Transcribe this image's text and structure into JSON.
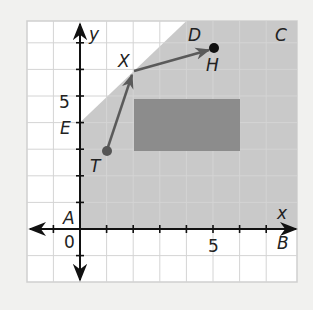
{
  "figure": {
    "type": "coordinate-plane",
    "grid": {
      "x_min": -2,
      "x_max": 8,
      "y_min": -2,
      "y_max": 8,
      "step": 1
    },
    "axes": {
      "x_label": "x",
      "y_label": "y",
      "origin_label": "0",
      "x_tick_label": "5",
      "y_tick_label": "5"
    },
    "shaded_region": {
      "vertices": [
        [
          0,
          0
        ],
        [
          8,
          0
        ],
        [
          8,
          8
        ],
        [
          4,
          8
        ],
        [
          0,
          4
        ]
      ],
      "color": "#c9c9c9"
    },
    "rectangle": {
      "x1": 2,
      "y1": 3,
      "x2": 6,
      "y2": 5,
      "color": "#8c8c8c"
    },
    "vertex_labels": [
      {
        "name": "A",
        "text": "A",
        "at": [
          0,
          0
        ]
      },
      {
        "name": "B",
        "text": "B",
        "at": [
          8,
          0
        ]
      },
      {
        "name": "C",
        "text": "C",
        "at": [
          8,
          8
        ]
      },
      {
        "name": "D",
        "text": "D",
        "at": [
          4,
          8
        ]
      },
      {
        "name": "E",
        "text": "E",
        "at": [
          0,
          4
        ]
      }
    ],
    "points": [
      {
        "name": "T",
        "text": "T",
        "at": [
          1,
          3
        ],
        "color": "#555555"
      },
      {
        "name": "X",
        "text": "X",
        "at": [
          2,
          6
        ]
      },
      {
        "name": "H",
        "text": "H",
        "at": [
          5,
          7
        ],
        "color": "#111111"
      }
    ],
    "path": {
      "from": "T",
      "via": "X",
      "to": "H",
      "color": "#5a5a5a"
    }
  },
  "labels": {
    "x_axis": "x",
    "y_axis": "y",
    "origin": "0",
    "x_five": "5",
    "y_five": "5",
    "A": "A",
    "B": "B",
    "C": "C",
    "D": "D",
    "E": "E",
    "T": "T",
    "X": "X",
    "H": "H"
  }
}
